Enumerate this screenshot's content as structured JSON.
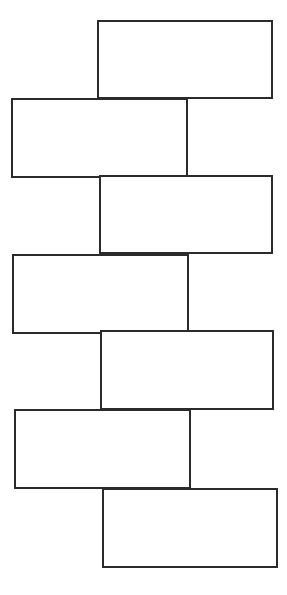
{
  "canvas": {
    "width": 287,
    "height": 595,
    "background_color": "#ffffff"
  },
  "style": {
    "stroke_color": "#2b2b2b",
    "stroke_width": 2,
    "fill_color": "#ffffff"
  },
  "diagram": {
    "type": "staggered-blank-rectangles",
    "shape_count": 7,
    "shapes": [
      {
        "name": "rectangle-1",
        "label": "",
        "align": "right",
        "x": 98,
        "y": 21,
        "width": 174,
        "height": 77
      },
      {
        "name": "rectangle-2",
        "label": "",
        "align": "left",
        "x": 12,
        "y": 99,
        "width": 175,
        "height": 78
      },
      {
        "name": "rectangle-3",
        "label": "",
        "align": "right",
        "x": 100,
        "y": 176,
        "width": 172,
        "height": 77
      },
      {
        "name": "rectangle-4",
        "label": "",
        "align": "left",
        "x": 13,
        "y": 255,
        "width": 175,
        "height": 78
      },
      {
        "name": "rectangle-5",
        "label": "",
        "align": "right",
        "x": 101,
        "y": 331,
        "width": 172,
        "height": 78
      },
      {
        "name": "rectangle-6",
        "label": "",
        "align": "left",
        "x": 15,
        "y": 410,
        "width": 175,
        "height": 78
      },
      {
        "name": "rectangle-7",
        "label": "",
        "align": "right",
        "x": 103,
        "y": 489,
        "width": 174,
        "height": 78
      }
    ]
  }
}
